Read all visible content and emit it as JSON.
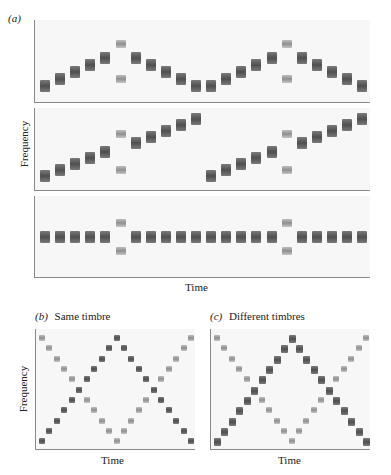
{
  "figure": {
    "panel_a_label": "(a)",
    "panel_b_label": "(b)",
    "panel_b_title": "Same timbre",
    "panel_c_label": "(c)",
    "panel_c_title": "Different timbres",
    "ylabel": "Frequency",
    "xlabel": "Time"
  },
  "colors": {
    "panel_bg": "#f7f7f7",
    "axis": "#8a8a8a",
    "dark_tone": "#555555",
    "light_tone": "#a0a0a0"
  },
  "panel_a": {
    "rows": [
      {
        "name": "rise-and-fall",
        "steps": 22,
        "notes": [
          {
            "t": 0,
            "lv": 0,
            "c": "dark"
          },
          {
            "t": 1,
            "lv": 1,
            "c": "dark"
          },
          {
            "t": 2,
            "lv": 2,
            "c": "dark"
          },
          {
            "t": 3,
            "lv": 3,
            "c": "dark"
          },
          {
            "t": 4,
            "lv": 4,
            "c": "dark"
          },
          {
            "t": 5,
            "lv": 6,
            "c": "light"
          },
          {
            "t": 5,
            "lv": 1,
            "c": "light"
          },
          {
            "t": 6,
            "lv": 4,
            "c": "dark"
          },
          {
            "t": 7,
            "lv": 3,
            "c": "dark"
          },
          {
            "t": 8,
            "lv": 2,
            "c": "dark"
          },
          {
            "t": 9,
            "lv": 1,
            "c": "dark"
          },
          {
            "t": 10,
            "lv": 0,
            "c": "dark"
          },
          {
            "t": 11,
            "lv": 0,
            "c": "dark"
          },
          {
            "t": 12,
            "lv": 1,
            "c": "dark"
          },
          {
            "t": 13,
            "lv": 2,
            "c": "dark"
          },
          {
            "t": 14,
            "lv": 3,
            "c": "dark"
          },
          {
            "t": 15,
            "lv": 4,
            "c": "dark"
          },
          {
            "t": 16,
            "lv": 6,
            "c": "light"
          },
          {
            "t": 16,
            "lv": 1,
            "c": "light"
          },
          {
            "t": 17,
            "lv": 4,
            "c": "dark"
          },
          {
            "t": 18,
            "lv": 3,
            "c": "dark"
          },
          {
            "t": 19,
            "lv": 2,
            "c": "dark"
          },
          {
            "t": 20,
            "lv": 1,
            "c": "dark"
          },
          {
            "t": 21,
            "lv": 0,
            "c": "dark"
          }
        ]
      },
      {
        "name": "ascending-steps",
        "steps": 22,
        "notes": [
          {
            "t": 0,
            "lv": 0,
            "c": "dark"
          },
          {
            "t": 1,
            "lv": 1,
            "c": "dark"
          },
          {
            "t": 2,
            "lv": 2,
            "c": "dark"
          },
          {
            "t": 3,
            "lv": 3,
            "c": "dark"
          },
          {
            "t": 4,
            "lv": 4,
            "c": "dark"
          },
          {
            "t": 5,
            "lv": 7,
            "c": "light"
          },
          {
            "t": 5,
            "lv": 1,
            "c": "light"
          },
          {
            "t": 6,
            "lv": 5.5,
            "c": "dark"
          },
          {
            "t": 7,
            "lv": 6.5,
            "c": "dark"
          },
          {
            "t": 8,
            "lv": 7.5,
            "c": "dark"
          },
          {
            "t": 9,
            "lv": 8.5,
            "c": "dark"
          },
          {
            "t": 10,
            "lv": 9.5,
            "c": "dark"
          },
          {
            "t": 11,
            "lv": 0,
            "c": "dark"
          },
          {
            "t": 12,
            "lv": 1,
            "c": "dark"
          },
          {
            "t": 13,
            "lv": 2,
            "c": "dark"
          },
          {
            "t": 14,
            "lv": 3,
            "c": "dark"
          },
          {
            "t": 15,
            "lv": 4,
            "c": "dark"
          },
          {
            "t": 16,
            "lv": 7,
            "c": "light"
          },
          {
            "t": 16,
            "lv": 1,
            "c": "light"
          },
          {
            "t": 17,
            "lv": 5.5,
            "c": "dark"
          },
          {
            "t": 18,
            "lv": 6.5,
            "c": "dark"
          },
          {
            "t": 19,
            "lv": 7.5,
            "c": "dark"
          },
          {
            "t": 20,
            "lv": 8.5,
            "c": "dark"
          },
          {
            "t": 21,
            "lv": 9.5,
            "c": "dark"
          }
        ]
      },
      {
        "name": "constant",
        "steps": 22,
        "notes": [
          {
            "t": 0,
            "lv": 0,
            "c": "dark"
          },
          {
            "t": 1,
            "lv": 0,
            "c": "dark"
          },
          {
            "t": 2,
            "lv": 0,
            "c": "dark"
          },
          {
            "t": 3,
            "lv": 0,
            "c": "dark"
          },
          {
            "t": 4,
            "lv": 0,
            "c": "dark"
          },
          {
            "t": 5,
            "lv": 2,
            "c": "light"
          },
          {
            "t": 5,
            "lv": -2,
            "c": "light"
          },
          {
            "t": 6,
            "lv": 0,
            "c": "dark"
          },
          {
            "t": 7,
            "lv": 0,
            "c": "dark"
          },
          {
            "t": 8,
            "lv": 0,
            "c": "dark"
          },
          {
            "t": 9,
            "lv": 0,
            "c": "dark"
          },
          {
            "t": 10,
            "lv": 0,
            "c": "dark"
          },
          {
            "t": 11,
            "lv": 0,
            "c": "dark"
          },
          {
            "t": 12,
            "lv": 0,
            "c": "dark"
          },
          {
            "t": 13,
            "lv": 0,
            "c": "dark"
          },
          {
            "t": 14,
            "lv": 0,
            "c": "dark"
          },
          {
            "t": 15,
            "lv": 0,
            "c": "dark"
          },
          {
            "t": 16,
            "lv": 2,
            "c": "light"
          },
          {
            "t": 16,
            "lv": -2,
            "c": "light"
          },
          {
            "t": 17,
            "lv": 0,
            "c": "dark"
          },
          {
            "t": 18,
            "lv": 0,
            "c": "dark"
          },
          {
            "t": 19,
            "lv": 0,
            "c": "dark"
          },
          {
            "t": 20,
            "lv": 0,
            "c": "dark"
          },
          {
            "t": 21,
            "lv": 0,
            "c": "dark"
          }
        ]
      }
    ]
  },
  "panel_b": {
    "steps": 21,
    "levels": 12,
    "voice_down_color": "light",
    "voice_up_color": "dark"
  },
  "panel_c": {
    "steps": 21,
    "levels": 12,
    "voice_down_color": "light",
    "voice_up_color": "dark"
  }
}
